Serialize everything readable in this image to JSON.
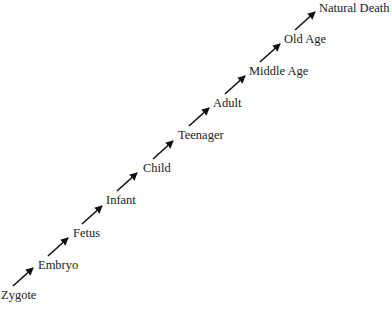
{
  "diagram": {
    "type": "flow",
    "direction": "bottom-left to top-right",
    "stages": [
      {
        "label": "Zygote",
        "x": 1,
        "y": 288
      },
      {
        "label": "Embryo",
        "x": 38,
        "y": 258
      },
      {
        "label": "Fetus",
        "x": 73,
        "y": 226
      },
      {
        "label": "Infant",
        "x": 106,
        "y": 193
      },
      {
        "label": "Child",
        "x": 143,
        "y": 161
      },
      {
        "label": "Teenager",
        "x": 178,
        "y": 128
      },
      {
        "label": "Adult",
        "x": 213,
        "y": 96
      },
      {
        "label": "Middle Age",
        "x": 249,
        "y": 64
      },
      {
        "label": "Old Age",
        "x": 284,
        "y": 32
      },
      {
        "label": "Natural Death",
        "x": 319,
        "y": 1
      }
    ],
    "arrows": [
      {
        "from": "Zygote",
        "to": "Embryo",
        "x1": 13,
        "y1": 286,
        "x2": 33,
        "y2": 268
      },
      {
        "from": "Embryo",
        "to": "Fetus",
        "x1": 48,
        "y1": 256,
        "x2": 68,
        "y2": 238
      },
      {
        "from": "Fetus",
        "to": "Infant",
        "x1": 82,
        "y1": 224,
        "x2": 102,
        "y2": 206
      },
      {
        "from": "Infant",
        "to": "Child",
        "x1": 117,
        "y1": 191,
        "x2": 137,
        "y2": 173
      },
      {
        "from": "Child",
        "to": "Teenager",
        "x1": 153,
        "y1": 159,
        "x2": 173,
        "y2": 141
      },
      {
        "from": "Teenager",
        "to": "Adult",
        "x1": 189,
        "y1": 126,
        "x2": 209,
        "y2": 108
      },
      {
        "from": "Adult",
        "to": "Middle Age",
        "x1": 225,
        "y1": 94,
        "x2": 245,
        "y2": 76
      },
      {
        "from": "Middle Age",
        "to": "Old Age",
        "x1": 260,
        "y1": 62,
        "x2": 280,
        "y2": 44
      },
      {
        "from": "Old Age",
        "to": "Natural Death",
        "x1": 295,
        "y1": 30,
        "x2": 315,
        "y2": 12
      }
    ],
    "colors": {
      "arrow": "#111111",
      "text": "#222222",
      "background": "#ffffff"
    }
  }
}
